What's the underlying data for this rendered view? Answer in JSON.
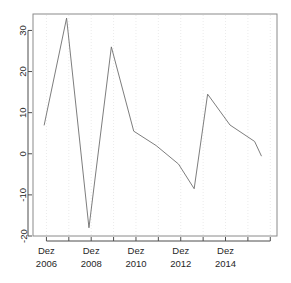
{
  "figure": {
    "title_remnant": "",
    "background_color": "#ffffff",
    "panel_border_color": "#8a8a8a",
    "line_color": "#6e6e6e",
    "grid_color": "#ebebeb",
    "axis_color": "#4d4d4d",
    "text_color": "#272727"
  },
  "chart_data": {
    "type": "line",
    "title": "",
    "xlabel": "",
    "ylabel": "",
    "ylim": [
      -20,
      34
    ],
    "xlim": [
      2005.4,
      2016.3
    ],
    "grid": true,
    "grid_orientation": "vertical",
    "legend": "none",
    "y_ticks": [
      30,
      20,
      10,
      0,
      -10,
      -20
    ],
    "y_tick_labels": [
      "30",
      "20",
      "10",
      "0",
      "-10",
      "-20"
    ],
    "x_tick_values": [
      2006,
      2007,
      2008,
      2009,
      2010,
      2011,
      2012,
      2013,
      2014,
      2015,
      2016
    ],
    "x_tick_labels": [
      {
        "month": "Dez",
        "year": "2006"
      },
      {
        "month": "Dez",
        "year": "2008"
      },
      {
        "month": "Dez",
        "year": "2010"
      },
      {
        "month": "Dez",
        "year": "2012"
      },
      {
        "month": "Dez",
        "year": "2014"
      }
    ],
    "x_labelled_values": [
      2006,
      2008,
      2010,
      2012,
      2014
    ],
    "x": [
      2005.9,
      2006.9,
      2007.9,
      2008.9,
      2009.9,
      2010.9,
      2011.9,
      2012.6,
      2013.2,
      2014.2,
      2015.3,
      2015.6
    ],
    "values": [
      7,
      33,
      -18,
      26,
      5.5,
      2,
      -2.5,
      -8.5,
      14.5,
      7,
      3,
      -0.5
    ],
    "series": [
      {
        "name": "series-1",
        "x": [
          2005.9,
          2006.9,
          2007.9,
          2008.9,
          2009.9,
          2010.9,
          2011.9,
          2012.6,
          2013.2,
          2014.2,
          2015.3,
          2015.6
        ],
        "values": [
          7,
          33,
          -18,
          26,
          5.5,
          2,
          -2.5,
          -8.5,
          14.5,
          7,
          3,
          -0.5
        ]
      }
    ]
  }
}
